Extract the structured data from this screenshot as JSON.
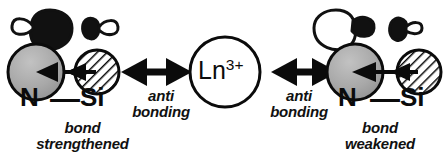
{
  "diagram": {
    "colors": {
      "stroke": "#0b0b0b",
      "nitrogen_fill": "#a8a8a8",
      "silicon_fill": "#ffffff",
      "lobe_filled": "#111111",
      "lobe_empty": "#ffffff",
      "background": "#ffffff"
    },
    "center": {
      "label_base": "Ln",
      "label_charge": "3+",
      "shape": "circle-outline"
    },
    "left_fragment": {
      "atom_label_n": "N",
      "atom_bond": "—",
      "atom_label_si": "Si",
      "caption_line1": "bond",
      "caption_line2": "strengthened",
      "interaction_line1": "anti",
      "interaction_line2": "bonding",
      "orbital_large_fill": "filled",
      "orbital_small_fill": "filled",
      "bond_arrow_direction": "left"
    },
    "right_fragment": {
      "atom_label_n": "N",
      "atom_bond": "—",
      "atom_label_si": "Si",
      "caption_line1": "bond",
      "caption_line2": "weakened",
      "interaction_line1": "anti",
      "interaction_line2": "bonding",
      "orbital_large_fill": "empty",
      "orbital_small_fill": "filled",
      "bond_arrow_direction": "left"
    }
  }
}
